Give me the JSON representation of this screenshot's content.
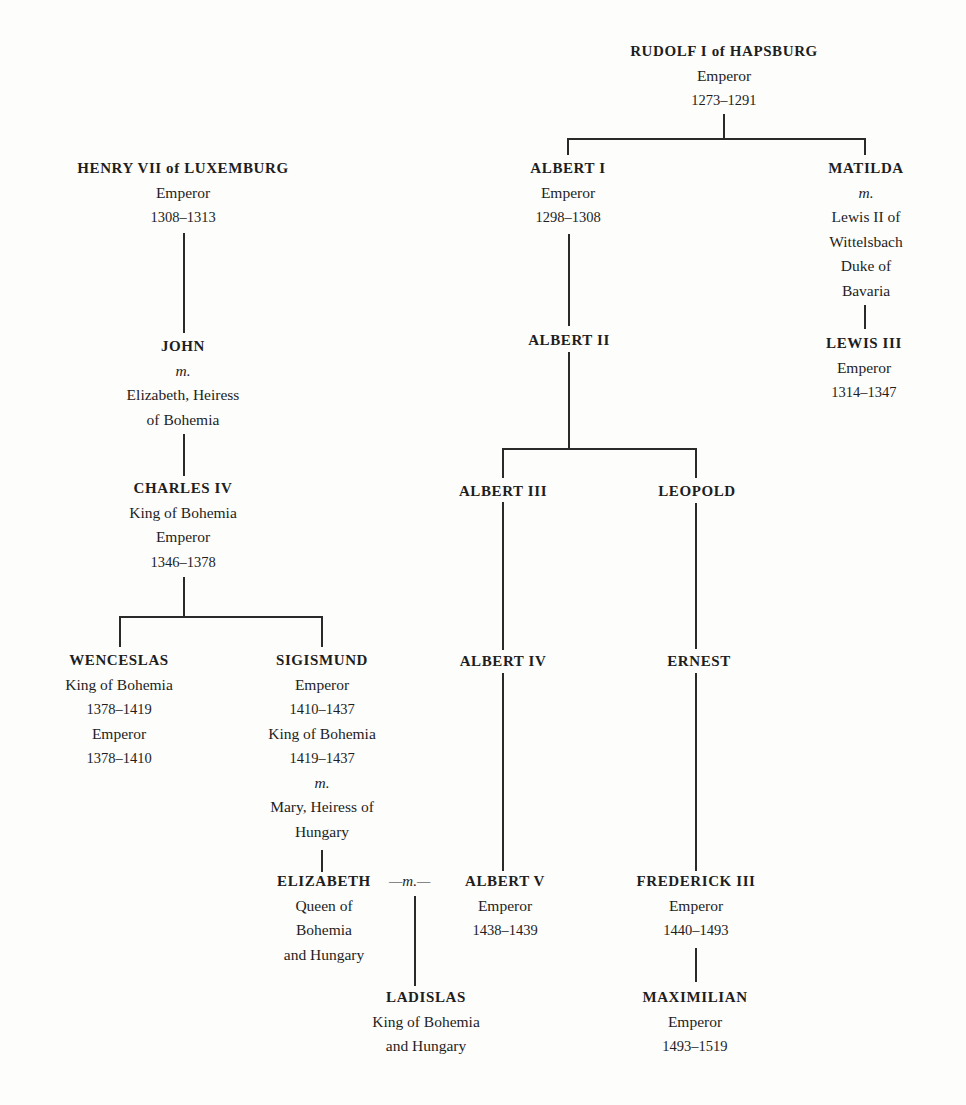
{
  "diagram": {
    "type": "family-tree",
    "nodes": {
      "rudolf": {
        "name": "RUDOLF I of HAPSBURG",
        "lines": [
          "Emperor",
          "1273–1291"
        ]
      },
      "henry": {
        "name": "HENRY VII of LUXEMBURG",
        "lines": [
          "Emperor",
          "1308–1313"
        ]
      },
      "albert1": {
        "name": "ALBERT I",
        "lines": [
          "Emperor",
          "1298–1308"
        ]
      },
      "matilda": {
        "name": "MATILDA",
        "lines": [
          "m.",
          "Lewis II of",
          "Wittelsbach",
          "Duke of",
          "Bavaria"
        ]
      },
      "john": {
        "name": "JOHN",
        "lines": [
          "m.",
          "Elizabeth, Heiress",
          "of Bohemia"
        ]
      },
      "albert2": {
        "name": "ALBERT II",
        "lines": []
      },
      "lewis3": {
        "name": "LEWIS III",
        "lines": [
          "Emperor",
          "1314–1347"
        ]
      },
      "charles4": {
        "name": "CHARLES IV",
        "lines": [
          "King of Bohemia",
          "Emperor",
          "1346–1378"
        ]
      },
      "albert3": {
        "name": "ALBERT III",
        "lines": []
      },
      "leopold": {
        "name": "LEOPOLD",
        "lines": []
      },
      "wenceslas": {
        "name": "WENCESLAS",
        "lines": [
          "King of Bohemia",
          "1378–1419",
          "Emperor",
          "1378–1410"
        ]
      },
      "sigismund": {
        "name": "SIGISMUND",
        "lines": [
          "Emperor",
          "1410–1437",
          "King of Bohemia",
          "1419–1437",
          "m.",
          "Mary, Heiress of",
          "Hungary"
        ]
      },
      "albert4": {
        "name": "ALBERT IV",
        "lines": []
      },
      "ernest": {
        "name": "ERNEST",
        "lines": []
      },
      "elizabeth": {
        "name": "ELIZABETH",
        "lines": [
          "Queen of",
          "Bohemia",
          "and Hungary"
        ]
      },
      "albert5": {
        "name": "ALBERT V",
        "lines": [
          "Emperor",
          "1438–1439"
        ]
      },
      "frederick3": {
        "name": "FREDERICK III",
        "lines": [
          "Emperor",
          "1440–1493"
        ]
      },
      "ladislas": {
        "name": "LADISLAS",
        "lines": [
          "King of Bohemia",
          "and Hungary"
        ]
      },
      "maximilian": {
        "name": "MAXIMILIAN",
        "lines": [
          "Emperor",
          "1493–1519"
        ]
      }
    },
    "marriage_label": "—m.—",
    "edges": [
      [
        "rudolf",
        "albert1"
      ],
      [
        "rudolf",
        "matilda"
      ],
      [
        "henry",
        "john"
      ],
      [
        "john",
        "charles4"
      ],
      [
        "charles4",
        "wenceslas"
      ],
      [
        "charles4",
        "sigismund"
      ],
      [
        "sigismund",
        "elizabeth"
      ],
      [
        "albert1",
        "albert2"
      ],
      [
        "albert2",
        "albert3"
      ],
      [
        "albert2",
        "leopold"
      ],
      [
        "albert3",
        "albert4"
      ],
      [
        "albert4",
        "albert5"
      ],
      [
        "leopold",
        "ernest"
      ],
      [
        "ernest",
        "frederick3"
      ],
      [
        "frederick3",
        "maximilian"
      ],
      [
        "matilda",
        "lewis3"
      ],
      [
        "elizabeth+albert5",
        "ladislas"
      ]
    ]
  }
}
